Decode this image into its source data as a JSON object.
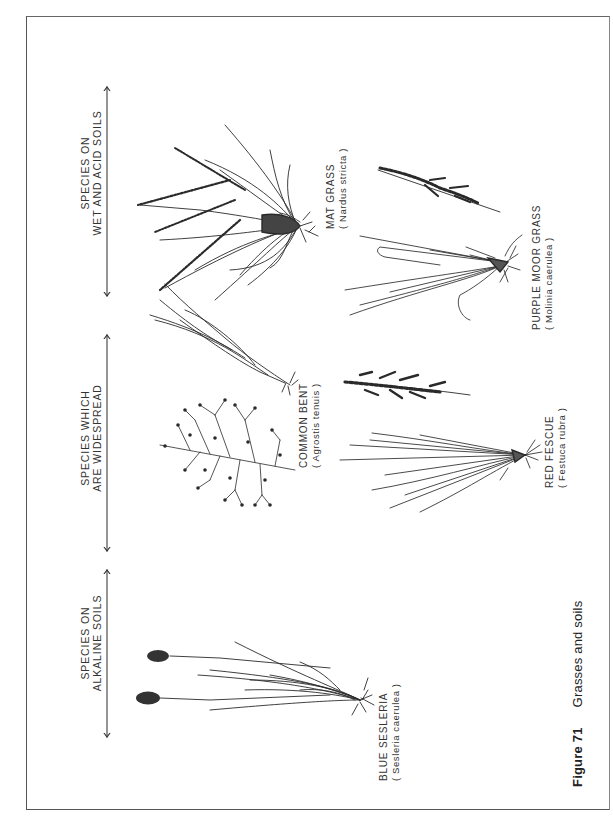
{
  "figure": {
    "number_label": "Figure 71",
    "title": "Grasses and soils"
  },
  "groups": [
    {
      "id": "wet-acid",
      "header_line1": "SPECIES ON",
      "header_line2": "WET AND ACID SOILS",
      "species": [
        {
          "common": "MAT GRASS",
          "latin": "( Nardus stricta )"
        },
        {
          "common": "PURPLE MOOR GRASS",
          "latin": "( Molinia caerulea )"
        }
      ]
    },
    {
      "id": "widespread",
      "header_line1": "SPECIES WHICH",
      "header_line2": "ARE WIDESPREAD",
      "species": [
        {
          "common": "COMMON BENT",
          "latin": "( Agrostis tenuis )"
        },
        {
          "common": "RED FESCUE",
          "latin": "( Festuca rubra )"
        }
      ]
    },
    {
      "id": "alkaline",
      "header_line1": "SPECIES ON",
      "header_line2": "ALKALINE SOILS",
      "species": [
        {
          "common": "BLUE SESLERIA",
          "latin": "( Sesleria caerulea )"
        }
      ]
    }
  ],
  "orientation": "rotated -90deg (page in landscape)",
  "colors": {
    "ink": "#2a2a2a",
    "paper": "#ffffff",
    "frame": "#555555"
  }
}
